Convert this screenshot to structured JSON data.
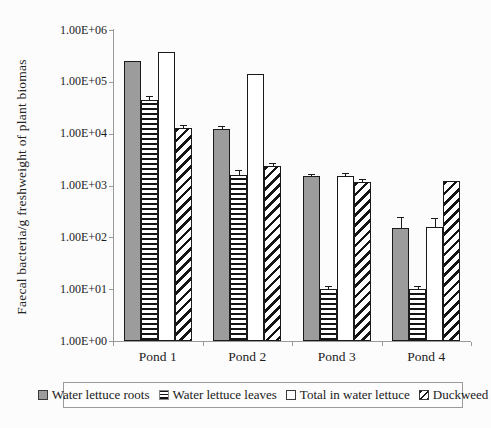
{
  "chart_data": {
    "type": "bar",
    "scale": "log",
    "title": "",
    "xlabel": "",
    "ylabel": "Faecal bacteria/g freshweight of plant biomas",
    "ylim": [
      1,
      1000000
    ],
    "ytick_labels": [
      "1.00E+06",
      "1.00E+05",
      "1.00E+04",
      "1.00E+03",
      "1.00E+02",
      "1.00E+01",
      "1.00E+00"
    ],
    "grid": "off",
    "legend_position": "bottom",
    "categories": [
      "Pond 1",
      "Pond 2",
      "Pond 3",
      "Pond 4"
    ],
    "series": [
      {
        "name": "Water lettuce roots",
        "pattern": "solid-gray",
        "color": "#9c9c9c",
        "values": [
          250000,
          12500,
          1500,
          150
        ],
        "errors_upper": [
          null,
          13500,
          1600,
          240
        ]
      },
      {
        "name": "Water lettuce leaves",
        "pattern": "horizontal-stripes",
        "color": "#141414",
        "values": [
          45000,
          1600,
          10,
          10
        ],
        "errors_upper": [
          52000,
          1900,
          11,
          11
        ]
      },
      {
        "name": "Total in water lettuce",
        "pattern": "white",
        "color": "#ffffff",
        "values": [
          380000,
          140000,
          1500,
          155
        ],
        "errors_upper": [
          null,
          null,
          1650,
          230
        ]
      },
      {
        "name": "Duckweed",
        "pattern": "diagonal-hatch",
        "color": "#141414",
        "values": [
          13000,
          2400,
          1150,
          1200
        ],
        "errors_upper": [
          14000,
          2650,
          1250,
          null
        ]
      }
    ]
  }
}
